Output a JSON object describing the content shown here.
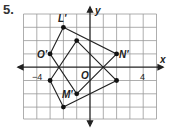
{
  "problem_number": "5.",
  "axes": {
    "x_label": "x",
    "y_label": "y",
    "origin_label": "O",
    "tick_labels": [
      "−4",
      "4"
    ]
  },
  "grid": {
    "x_min": -5,
    "x_max": 5,
    "y_min": -3,
    "y_max": 4
  },
  "figures": [
    {
      "name": "L'M'N'O'",
      "vertices": [
        {
          "label": "L'",
          "x": -2,
          "y": 3
        },
        {
          "label": "N'",
          "x": 2,
          "y": 1
        },
        {
          "label": "M'",
          "x": -1,
          "y": -2
        },
        {
          "label": "O'",
          "x": -3,
          "y": 1
        }
      ]
    },
    {
      "name": "LMNO",
      "vertices": [
        {
          "label": "",
          "x": -1,
          "y": 2
        },
        {
          "label": "",
          "x": 2,
          "y": -1
        },
        {
          "label": "",
          "x": -2,
          "y": -3
        },
        {
          "label": "",
          "x": -3,
          "y": -1
        }
      ]
    }
  ],
  "labels": {
    "L": "L'",
    "M": "M'",
    "N": "N'",
    "O": "O'"
  }
}
